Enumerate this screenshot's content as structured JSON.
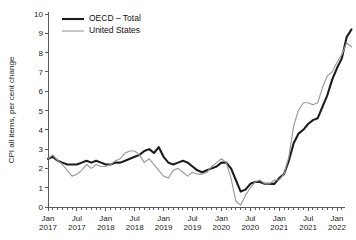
{
  "chart_data": {
    "type": "line",
    "title": "",
    "xlabel": "",
    "ylabel": "CPI all items, per cent change",
    "ylim": [
      0,
      10
    ],
    "yticks": [
      0,
      1,
      2,
      3,
      4,
      5,
      6,
      7,
      8,
      9,
      10
    ],
    "ytick_labels": [
      "0",
      "1",
      "2",
      "3",
      "4",
      "5",
      "6",
      "7",
      "8",
      "9",
      "10"
    ],
    "grid": false,
    "legend_position": "top-left",
    "xtick_labels": [
      {
        "line1": "Jan",
        "line2": "2017"
      },
      {
        "line1": "Jul",
        "line2": "2017"
      },
      {
        "line1": "Jan",
        "line2": "2018"
      },
      {
        "line1": "Jul",
        "line2": "2018"
      },
      {
        "line1": "Jan",
        "line2": "2019"
      },
      {
        "line1": "Jul",
        "line2": "2019"
      },
      {
        "line1": "Jan",
        "line2": "2020"
      },
      {
        "line1": "Jul",
        "line2": "2020"
      },
      {
        "line1": "Jan",
        "line2": "2021"
      },
      {
        "line1": "Jul",
        "line2": "2021"
      },
      {
        "line1": "Jan",
        "line2": "2022"
      }
    ],
    "x_start": "2017-01",
    "x_end": "2022-05",
    "x_tick_interval_months": 6,
    "x_minor_tick_interval_months": 1,
    "colors": {
      "oecd": "#1c1c1c",
      "united_states": "#9a9a9a",
      "axis": "#5a5a5a",
      "text": "#111111",
      "background": "#ffffff"
    },
    "series": [
      {
        "name": "OECD – Total",
        "color": "#1c1c1c",
        "values": [
          2.5,
          2.6,
          2.4,
          2.3,
          2.2,
          2.2,
          2.2,
          2.3,
          2.4,
          2.3,
          2.4,
          2.3,
          2.2,
          2.2,
          2.3,
          2.3,
          2.4,
          2.5,
          2.6,
          2.7,
          2.9,
          3.0,
          2.8,
          3.1,
          2.6,
          2.3,
          2.2,
          2.3,
          2.4,
          2.3,
          2.1,
          1.9,
          1.8,
          1.9,
          2.0,
          2.1,
          2.3,
          2.3,
          2.0,
          1.4,
          0.8,
          0.9,
          1.2,
          1.3,
          1.3,
          1.2,
          1.2,
          1.2,
          1.5,
          1.7,
          2.4,
          3.3,
          3.8,
          4.0,
          4.3,
          4.5,
          4.6,
          5.2,
          5.8,
          6.6,
          7.2,
          7.7,
          8.8,
          9.2
        ]
      },
      {
        "name": "United States",
        "color": "#9a9a9a",
        "values": [
          2.5,
          2.7,
          2.4,
          2.2,
          1.9,
          1.6,
          1.7,
          1.9,
          2.2,
          2.0,
          2.2,
          2.1,
          2.1,
          2.2,
          2.4,
          2.5,
          2.8,
          2.9,
          2.9,
          2.7,
          2.3,
          2.5,
          2.2,
          1.9,
          1.6,
          1.5,
          1.9,
          2.0,
          1.8,
          1.6,
          1.8,
          1.7,
          1.7,
          1.8,
          2.1,
          2.3,
          2.5,
          2.3,
          1.5,
          0.3,
          0.1,
          0.6,
          1.0,
          1.3,
          1.4,
          1.2,
          1.2,
          1.4,
          1.4,
          1.7,
          2.6,
          4.2,
          5.0,
          5.4,
          5.4,
          5.3,
          5.4,
          6.2,
          6.8,
          7.0,
          7.5,
          7.9,
          8.5,
          8.3
        ]
      }
    ],
    "legend": [
      {
        "label": "OECD – Total",
        "color": "#1c1c1c",
        "style": "thick"
      },
      {
        "label": "United States",
        "color": "#9a9a9a",
        "style": "thin"
      }
    ]
  }
}
